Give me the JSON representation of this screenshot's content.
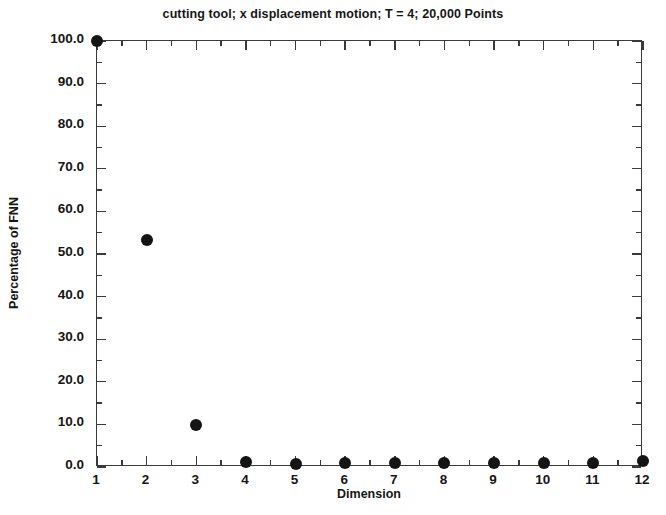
{
  "chart_data": {
    "type": "scatter",
    "title": "cutting tool; x displacement motion; T = 4; 20,000 Points",
    "xlabel": "Dimension",
    "ylabel": "Percentage of FNN",
    "x": [
      1,
      2,
      3,
      4,
      5,
      6,
      7,
      8,
      9,
      10,
      11,
      12
    ],
    "values": [
      100.0,
      53.3,
      9.8,
      1.2,
      0.8,
      0.9,
      0.9,
      1.0,
      1.0,
      1.0,
      1.0,
      1.5
    ],
    "series": [
      {
        "name": "Percentage of FNN",
        "values": [
          100.0,
          53.3,
          9.8,
          1.2,
          0.8,
          0.9,
          0.9,
          1.0,
          1.0,
          1.0,
          1.0,
          1.5
        ]
      }
    ],
    "xlim": [
      1,
      12
    ],
    "ylim": [
      0,
      100
    ],
    "xticks": [
      1,
      2,
      3,
      4,
      5,
      6,
      7,
      8,
      9,
      10,
      11,
      12
    ],
    "xtick_labels": [
      "1",
      "2",
      "3",
      "4",
      "5",
      "6",
      "7",
      "8",
      "9",
      "10",
      "11",
      "12"
    ],
    "yticks": [
      0,
      10,
      20,
      30,
      40,
      50,
      60,
      70,
      80,
      90,
      100
    ],
    "ytick_labels": [
      "0.0",
      "10.0",
      "20.0",
      "30.0",
      "40.0",
      "50.0",
      "60.0",
      "70.0",
      "80.0",
      "90.0",
      "100.0"
    ],
    "minor_ticks": true,
    "minor_tick_step_x": 0.5,
    "minor_tick_step_y": 5,
    "grid": false,
    "legend": null,
    "marker_color": "#141414",
    "marker_shape": "circle",
    "axis_color": "#3a3a3a",
    "background_color": "#ffffff"
  }
}
